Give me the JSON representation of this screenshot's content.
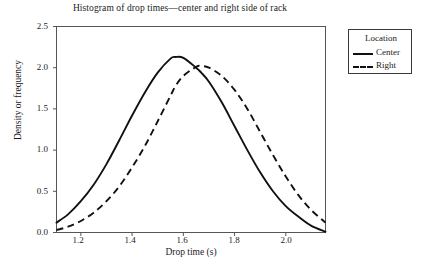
{
  "chart_data": {
    "type": "line",
    "title": "Histogram of drop times—center and right side of rack",
    "xlabel": "Drop time (s)",
    "ylabel": "Density or frequency",
    "xlim": [
      1.105,
      2.155
    ],
    "ylim": [
      0.0,
      2.5
    ],
    "grid": false,
    "legend_position": "right-outside",
    "legend_title": "Location",
    "xticks": [
      1.2,
      1.4,
      1.6,
      1.8,
      2.0
    ],
    "xtick_labels": [
      "1.2",
      "1.4",
      "1.6",
      "1.8",
      "2.0"
    ],
    "yticks": [
      0.0,
      0.5,
      1.0,
      1.5,
      2.0,
      2.5
    ],
    "ytick_labels": [
      "0.0",
      "0.5",
      "1.0",
      "1.5",
      "2.0",
      "2.5"
    ],
    "x": [
      1.105,
      1.15,
      1.2,
      1.25,
      1.3,
      1.35,
      1.4,
      1.45,
      1.5,
      1.55,
      1.57,
      1.6,
      1.65,
      1.67,
      1.7,
      1.75,
      1.8,
      1.85,
      1.9,
      1.95,
      2.0,
      2.05,
      2.1,
      2.155
    ],
    "series": [
      {
        "name": "Center",
        "style": "solid",
        "color": "#111111",
        "peak_x": 1.57,
        "peak_y": 2.13,
        "values": [
          0.12,
          0.22,
          0.38,
          0.58,
          0.83,
          1.12,
          1.42,
          1.7,
          1.94,
          2.11,
          2.13,
          2.12,
          2.0,
          1.94,
          1.83,
          1.58,
          1.29,
          1.0,
          0.73,
          0.5,
          0.32,
          0.19,
          0.08,
          0.01
        ]
      },
      {
        "name": "Right",
        "style": "dashed",
        "color": "#111111",
        "peak_x": 1.67,
        "peak_y": 2.02,
        "values": [
          0.03,
          0.07,
          0.14,
          0.24,
          0.38,
          0.56,
          0.79,
          1.05,
          1.35,
          1.66,
          1.78,
          1.9,
          2.01,
          2.02,
          2.0,
          1.9,
          1.73,
          1.5,
          1.22,
          0.94,
          0.68,
          0.45,
          0.27,
          0.12
        ]
      }
    ]
  }
}
